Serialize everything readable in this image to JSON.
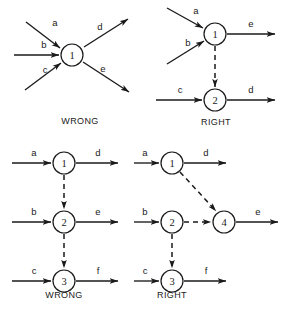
{
  "figure": {
    "colors": {
      "ink": "#1a1a1a",
      "background": "#ffffff",
      "node_fill": "#ffffff"
    },
    "legend": {
      "solid_meaning": "activity arrow",
      "dashed_meaning": "dummy activity arrow"
    }
  },
  "panels": [
    {
      "id": "top-left",
      "verdict": "WRONG",
      "verdict_pos": {
        "x": 80,
        "y": 124
      },
      "nodes": [
        {
          "id": "n1",
          "label": "1",
          "cx": 72,
          "cy": 55,
          "r": 11
        }
      ],
      "edges": [
        {
          "id": "a",
          "label": "a",
          "style": "solid",
          "x1": 26,
          "y1": 22,
          "x2": 60,
          "y2": 48,
          "label_x": 55,
          "label_y": 26
        },
        {
          "id": "b",
          "label": "b",
          "style": "solid",
          "x1": 14,
          "y1": 55,
          "x2": 59,
          "y2": 55,
          "label_x": 44,
          "label_y": 48
        },
        {
          "id": "c",
          "label": "c",
          "style": "solid",
          "x1": 25,
          "y1": 90,
          "x2": 61,
          "y2": 63,
          "label_x": 45,
          "label_y": 73
        },
        {
          "id": "d",
          "label": "d",
          "style": "solid",
          "x1": 84,
          "y1": 47,
          "x2": 128,
          "y2": 19,
          "label_x": 100,
          "label_y": 30
        },
        {
          "id": "e",
          "label": "e",
          "style": "solid",
          "x1": 83,
          "y1": 62,
          "x2": 129,
          "y2": 92,
          "label_x": 103,
          "label_y": 72
        }
      ]
    },
    {
      "id": "top-right",
      "verdict": "RIGHT",
      "verdict_pos": {
        "x": 216,
        "y": 125
      },
      "nodes": [
        {
          "id": "n1",
          "label": "1",
          "cx": 215,
          "cy": 34,
          "r": 11
        },
        {
          "id": "n2",
          "label": "2",
          "cx": 215,
          "cy": 100,
          "r": 11
        }
      ],
      "edges": [
        {
          "id": "a",
          "label": "a",
          "style": "solid",
          "x1": 167,
          "y1": 8,
          "x2": 203,
          "y2": 28,
          "label_x": 196,
          "label_y": 14
        },
        {
          "id": "b",
          "label": "b",
          "style": "solid",
          "x1": 167,
          "y1": 64,
          "x2": 204,
          "y2": 41,
          "label_x": 188,
          "label_y": 46
        },
        {
          "id": "e",
          "label": "e",
          "style": "solid",
          "x1": 227,
          "y1": 34,
          "x2": 275,
          "y2": 34,
          "label_x": 251,
          "label_y": 27
        },
        {
          "id": "c",
          "label": "c",
          "style": "solid",
          "x1": 156,
          "y1": 100,
          "x2": 202,
          "y2": 100,
          "label_x": 180,
          "label_y": 93
        },
        {
          "id": "d",
          "label": "d",
          "style": "solid",
          "x1": 227,
          "y1": 100,
          "x2": 275,
          "y2": 100,
          "label_x": 251,
          "label_y": 93
        },
        {
          "id": "dummy1",
          "label": "",
          "style": "dashed",
          "x1": 215,
          "y1": 46,
          "x2": 215,
          "y2": 87,
          "label_x": 0,
          "label_y": 0
        }
      ]
    },
    {
      "id": "bottom-left",
      "verdict": "WRONG",
      "verdict_pos": {
        "x": 64,
        "y": 298
      },
      "nodes": [
        {
          "id": "n1",
          "label": "1",
          "cx": 64,
          "cy": 163,
          "r": 11
        },
        {
          "id": "n2",
          "label": "2",
          "cx": 64,
          "cy": 222,
          "r": 11
        },
        {
          "id": "n3",
          "label": "3",
          "cx": 64,
          "cy": 281,
          "r": 11
        }
      ],
      "edges": [
        {
          "id": "a",
          "label": "a",
          "style": "solid",
          "x1": 12,
          "y1": 163,
          "x2": 51,
          "y2": 163,
          "label_x": 34,
          "label_y": 156
        },
        {
          "id": "d",
          "label": "d",
          "style": "solid",
          "x1": 76,
          "y1": 163,
          "x2": 118,
          "y2": 163,
          "label_x": 98,
          "label_y": 156
        },
        {
          "id": "b",
          "label": "b",
          "style": "solid",
          "x1": 12,
          "y1": 222,
          "x2": 51,
          "y2": 222,
          "label_x": 34,
          "label_y": 215
        },
        {
          "id": "e",
          "label": "e",
          "style": "solid",
          "x1": 76,
          "y1": 222,
          "x2": 118,
          "y2": 222,
          "label_x": 98,
          "label_y": 215
        },
        {
          "id": "c",
          "label": "c",
          "style": "solid",
          "x1": 12,
          "y1": 281,
          "x2": 51,
          "y2": 281,
          "label_x": 34,
          "label_y": 274
        },
        {
          "id": "f",
          "label": "f",
          "style": "solid",
          "x1": 76,
          "y1": 281,
          "x2": 118,
          "y2": 281,
          "label_x": 98,
          "label_y": 274
        },
        {
          "id": "dummy1",
          "label": "",
          "style": "dashed",
          "x1": 64,
          "y1": 175,
          "x2": 64,
          "y2": 209,
          "label_x": 0,
          "label_y": 0
        },
        {
          "id": "dummy2",
          "label": "",
          "style": "dashed",
          "x1": 64,
          "y1": 234,
          "x2": 64,
          "y2": 268,
          "label_x": 0,
          "label_y": 0
        }
      ]
    },
    {
      "id": "bottom-right",
      "verdict": "RIGHT",
      "verdict_pos": {
        "x": 172,
        "y": 298
      },
      "nodes": [
        {
          "id": "n1",
          "label": "1",
          "cx": 172,
          "cy": 163,
          "r": 11
        },
        {
          "id": "n2",
          "label": "2",
          "cx": 172,
          "cy": 222,
          "r": 11
        },
        {
          "id": "n3",
          "label": "3",
          "cx": 172,
          "cy": 281,
          "r": 11
        },
        {
          "id": "n4",
          "label": "4",
          "cx": 224,
          "cy": 222,
          "r": 11
        }
      ],
      "edges": [
        {
          "id": "a",
          "label": "a",
          "style": "solid",
          "x1": 134,
          "y1": 163,
          "x2": 159,
          "y2": 163,
          "label_x": 145,
          "label_y": 156
        },
        {
          "id": "d",
          "label": "d",
          "style": "solid",
          "x1": 184,
          "y1": 163,
          "x2": 226,
          "y2": 163,
          "label_x": 206,
          "label_y": 156
        },
        {
          "id": "b",
          "label": "b",
          "style": "solid",
          "x1": 134,
          "y1": 222,
          "x2": 159,
          "y2": 222,
          "label_x": 145,
          "label_y": 215
        },
        {
          "id": "e",
          "label": "e",
          "style": "solid",
          "x1": 236,
          "y1": 222,
          "x2": 278,
          "y2": 222,
          "label_x": 258,
          "label_y": 215
        },
        {
          "id": "c",
          "label": "c",
          "style": "solid",
          "x1": 134,
          "y1": 281,
          "x2": 159,
          "y2": 281,
          "label_x": 145,
          "label_y": 274
        },
        {
          "id": "f",
          "label": "f",
          "style": "solid",
          "x1": 184,
          "y1": 281,
          "x2": 226,
          "y2": 281,
          "label_x": 206,
          "label_y": 274
        },
        {
          "id": "dummy1",
          "label": "",
          "style": "dashed",
          "x1": 180,
          "y1": 172,
          "x2": 216,
          "y2": 211,
          "label_x": 0,
          "label_y": 0
        },
        {
          "id": "dummy2",
          "label": "",
          "style": "dashed",
          "x1": 184,
          "y1": 222,
          "x2": 211,
          "y2": 222,
          "label_x": 0,
          "label_y": 0
        },
        {
          "id": "dummy3",
          "label": "",
          "style": "dashed",
          "x1": 172,
          "y1": 234,
          "x2": 172,
          "y2": 268,
          "label_x": 0,
          "label_y": 0
        }
      ]
    }
  ]
}
